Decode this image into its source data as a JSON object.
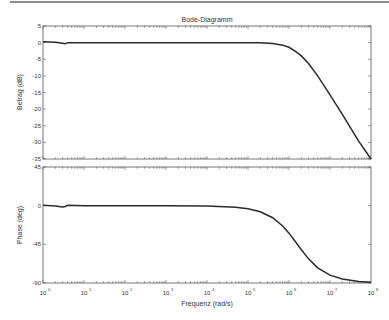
{
  "chart_data": [
    {
      "type": "line",
      "title": "Bode-Diagramm",
      "xlabel": "",
      "ylabel": "Betrag (dB)",
      "xscale": "log",
      "xlim": [
        1,
        100000000
      ],
      "ylim": [
        -35,
        5
      ],
      "yticks": [
        5,
        0,
        -5,
        -10,
        -15,
        -20,
        -25,
        -30,
        -35
      ],
      "grid": false,
      "series": [
        {
          "name": "Betrag",
          "x": [
            1,
            2,
            3,
            3.5,
            4,
            10,
            100,
            1000,
            10000,
            100000,
            200000,
            400000,
            700000,
            1000000,
            1500000,
            2000000,
            3000000,
            5000000,
            10000000,
            20000000,
            50000000,
            100000000
          ],
          "values": [
            0.3,
            0.1,
            -0.2,
            -0.3,
            0,
            0,
            0,
            0,
            0,
            -0.05,
            -0.07,
            -0.27,
            -0.76,
            -1.4,
            -2.8,
            -4.0,
            -6.3,
            -10.0,
            -15.7,
            -21.6,
            -29.6,
            -35.0
          ]
        }
      ]
    },
    {
      "type": "line",
      "title": "",
      "xlabel": "Frequenz  (rad/s)",
      "ylabel": "Phase (deg)",
      "xscale": "log",
      "xlim": [
        1,
        100000000
      ],
      "ylim": [
        -90,
        45
      ],
      "yticks": [
        45,
        0,
        -45,
        -90
      ],
      "xticks": [
        "10^0",
        "10^1",
        "10^2",
        "10^3",
        "10^4",
        "10^5",
        "10^6",
        "10^7",
        "10^8"
      ],
      "grid": false,
      "series": [
        {
          "name": "Phase",
          "x": [
            1,
            2,
            3,
            3.5,
            4,
            10,
            100,
            1000,
            10000,
            50000,
            100000,
            200000,
            400000,
            700000,
            1000000,
            1500000,
            2000000,
            3000000,
            5000000,
            10000000,
            20000000,
            50000000,
            100000000
          ],
          "values": [
            0.5,
            -0.5,
            -1.5,
            -1.0,
            0.5,
            0,
            0,
            0,
            -0.4,
            -1.8,
            -3.6,
            -7.1,
            -14.0,
            -23.6,
            -32.0,
            -43.2,
            -51.3,
            -61.9,
            -72.3,
            -80.9,
            -85.4,
            -88.2,
            -89.1
          ]
        }
      ]
    }
  ],
  "axes": {
    "title": "Bode-Diagramm",
    "magnitude_ylabel": "Betrag (dB)",
    "phase_ylabel": "Phase (deg)",
    "xlabel": "Frequenz  (rad/s)",
    "x_tick_bases": [
      "10",
      "10",
      "10",
      "10",
      "10",
      "10",
      "10",
      "10",
      "10"
    ],
    "x_tick_exponents": [
      "0",
      "1",
      "2",
      "3",
      "4",
      "5",
      "6",
      "7",
      "8"
    ],
    "magnitude_ticks": [
      "5",
      "0",
      "-5",
      "-10",
      "-15",
      "-20",
      "-25",
      "-30",
      "-35"
    ],
    "phase_ticks": [
      "45",
      "0",
      "-45",
      "-90"
    ]
  },
  "colors": {
    "curve": "#2a2a2a",
    "axes": "#555555",
    "text": "#333333"
  }
}
